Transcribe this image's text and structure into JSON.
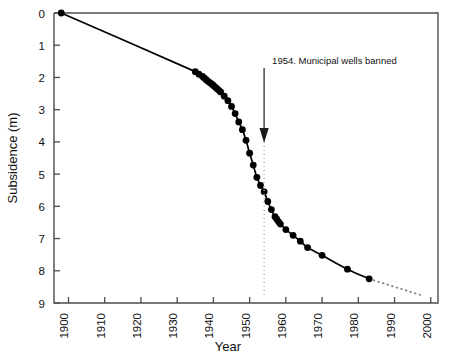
{
  "chart_data": {
    "type": "line",
    "title": "",
    "xlabel": "Year",
    "ylabel": "Subsidence (m)",
    "xlim": [
      1896,
      2002
    ],
    "ylim": [
      0,
      9
    ],
    "y_inverted": true,
    "grid": false,
    "legend_position": "none",
    "xticks": [
      1900,
      1910,
      1920,
      1930,
      1940,
      1950,
      1960,
      1970,
      1980,
      1990,
      2000
    ],
    "xtick_labels": [
      "1900",
      "1910",
      "1920",
      "1930",
      "1940",
      "1950",
      "1960",
      "1970",
      "1980",
      "1990",
      "2000"
    ],
    "yticks": [
      0,
      1,
      2,
      3,
      4,
      5,
      6,
      7,
      8,
      9
    ],
    "ytick_labels": [
      "0",
      "1",
      "2",
      "3",
      "4",
      "5",
      "6",
      "7",
      "8",
      "9"
    ],
    "series": [
      {
        "name": "Cumulative subsidence",
        "style": "solid-line-with-markers",
        "marker": "filled-circle",
        "color": "#000000",
        "x": [
          1898,
          1935,
          1936,
          1937,
          1937.5,
          1938,
          1938.5,
          1939,
          1939.5,
          1940,
          1940.5,
          1941,
          1941.5,
          1942,
          1943,
          1944,
          1945,
          1946,
          1947,
          1948,
          1949,
          1950,
          1951,
          1952,
          1953,
          1954,
          1955,
          1956,
          1957,
          1957.5,
          1958,
          1958.5,
          1960,
          1962,
          1964,
          1966,
          1970,
          1977,
          1983
        ],
        "y": [
          0.0,
          1.82,
          1.9,
          1.97,
          2.02,
          2.07,
          2.12,
          2.16,
          2.2,
          2.25,
          2.3,
          2.35,
          2.4,
          2.45,
          2.58,
          2.72,
          2.9,
          3.12,
          3.38,
          3.62,
          3.95,
          4.35,
          4.72,
          5.1,
          5.35,
          5.55,
          5.85,
          6.1,
          6.32,
          6.4,
          6.48,
          6.55,
          6.72,
          6.9,
          7.08,
          7.28,
          7.52,
          7.95,
          8.25
        ]
      },
      {
        "name": "Projected subsidence",
        "style": "dotted-line",
        "color": "#7a7a7a",
        "x": [
          1983,
          1998
        ],
        "y": [
          8.25,
          8.78
        ]
      }
    ],
    "annotations": [
      {
        "name": "municipal-wells-banned",
        "text": "1954. Municipal wells banned",
        "year": 1954,
        "arrow": "down",
        "guide_line": "vertical-dotted"
      }
    ]
  },
  "axes": {
    "x_title": "Year",
    "y_title": "Subsidence (m)"
  },
  "annotation": {
    "text": "1954. Municipal wells banned"
  },
  "colors": {
    "data": "#000000",
    "frame": "#4d4d4d",
    "projection": "#808080",
    "guide": "#a8a8a8",
    "background": "#ffffff"
  }
}
